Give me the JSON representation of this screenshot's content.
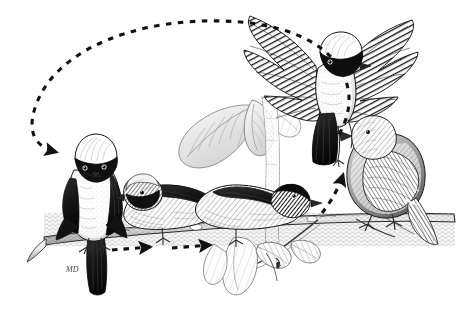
{
  "figure": {
    "title": "Bird display sequence",
    "medium": "pen-and-ink stipple / hatching drawing",
    "background_color": "#ffffff",
    "ink_color": "#1a1a1a",
    "mid_tone_color": "#6f6f6f",
    "light_tone_color": "#b9b9b9",
    "width_px": 463,
    "height_px": 313
  },
  "signature": {
    "label": "artist-monogram",
    "text": "MD",
    "x": 72,
    "y": 266
  },
  "branch": {
    "label": "perch-branch",
    "description": "horizontal woody branch spanning the scene, slightly angled, with a secondary twig descending at right",
    "left_x": 44,
    "right_x": 452,
    "y": 222
  },
  "foliage": [
    {
      "name": "leaf-cluster-upper-center",
      "description": "large pale ribbed leaves behind the perched birds",
      "x": 175,
      "y": 95
    },
    {
      "name": "leaf-cluster-lower-right",
      "description": "drooping leaves below the branch on the right half",
      "x": 235,
      "y": 235
    },
    {
      "name": "stem-vertical-center",
      "description": "pale vertical stem rising through the centre of the plate",
      "x": 268,
      "y": 100
    }
  ],
  "birds": [
    {
      "id": 1,
      "name": "bird-perched-left",
      "pose": "perched, facing viewer",
      "plumage": "white crown, black facial mask, white breast, dark wings and tail",
      "x": 96,
      "y": 190,
      "order_label": "1"
    },
    {
      "id": 2,
      "name": "bird-crouched-center-left",
      "pose": "crouched forward along branch, head low",
      "plumage": "pale crown, dark mask, dark mantle, pale underparts",
      "x": 178,
      "y": 190,
      "order_label": "2"
    },
    {
      "id": 3,
      "name": "bird-crouched-center-right",
      "pose": "crouched horizontally, body stretched along perch",
      "plumage": "dark head and mantle, pale flanks",
      "x": 250,
      "y": 196,
      "order_label": "3"
    },
    {
      "id": 4,
      "name": "bird-flying-display",
      "pose": "hovering with wings fully spread, tail fanned down",
      "plumage": "white crown, black mask, white breast, dark barred wings",
      "x": 330,
      "y": 70,
      "order_label": "4"
    },
    {
      "id": 5,
      "name": "bird-perched-right",
      "pose": "perched upright, facing left",
      "plumage": "finely hatched grey-brown overall, plain head",
      "x": 388,
      "y": 175,
      "order_label": "5"
    }
  ],
  "motion_arrows": [
    {
      "name": "arrow-return-arc",
      "style": "dashed",
      "direction": "right-to-left over the top of the plate",
      "head_at_x": 58,
      "head_at_y": 154,
      "description": "large dashed arc sweeping from the right side up and over to the left bird"
    },
    {
      "name": "arrow-along-branch-first",
      "style": "dashed",
      "direction": "left-to-right",
      "head_at_x": 155,
      "head_at_y": 246,
      "description": "short dashed arrow under the branch pointing right"
    },
    {
      "name": "arrow-along-branch-second",
      "style": "dashed",
      "direction": "left-to-right",
      "head_at_x": 215,
      "head_at_y": 244,
      "description": "second short dashed arrow under the branch pointing right"
    },
    {
      "name": "arrow-upward-to-flight",
      "style": "dashed",
      "direction": "upward / leftward curve",
      "head_at_x": 344,
      "head_at_y": 168,
      "description": "dashed arrow curving up from the branch toward the displaying bird in flight"
    }
  ]
}
